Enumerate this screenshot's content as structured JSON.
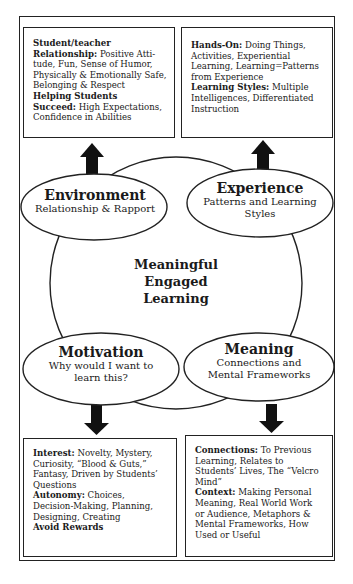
{
  "diagram": {
    "center": {
      "line1": "Meaningful",
      "line2": "Engaged",
      "line3": "Learning"
    },
    "ovals": {
      "environment": {
        "title": "Environment",
        "subtitle_line1": "Relationship & Rapport"
      },
      "experience": {
        "title": "Experience",
        "subtitle_line1": "Patterns and Learning",
        "subtitle_line2": "Styles"
      },
      "motivation": {
        "title": "Motivation",
        "subtitle_line1": "Why would I want to",
        "subtitle_line2": "learn this?"
      },
      "meaning": {
        "title": "Meaning",
        "subtitle_line1": "Connections and",
        "subtitle_line2": "Mental Frameworks"
      }
    },
    "boxes": {
      "environment": {
        "lines": [
          {
            "bold": "Student/teacher",
            "text": ""
          },
          {
            "bold": "Relationship:",
            "text": " Positive Atti-"
          },
          {
            "bold": "",
            "text": "tude, Fun, Sense of Humor,"
          },
          {
            "bold": "",
            "text": "Physically & Emotionally Safe,"
          },
          {
            "bold": "",
            "text": "Belonging & Respect"
          },
          {
            "bold": "Helping Students",
            "text": ""
          },
          {
            "bold": "Succeed:",
            "text": " High Expectations,"
          },
          {
            "bold": "",
            "text": "Confidence in Abilities"
          }
        ]
      },
      "experience": {
        "lines": [
          {
            "bold": "Hands-On:",
            "text": " Doing Things,"
          },
          {
            "bold": "",
            "text": "Activities, Experiential"
          },
          {
            "bold": "",
            "text": "Learning, Learning=Patterns"
          },
          {
            "bold": "",
            "text": "from Experience"
          },
          {
            "bold": "Learning Styles:",
            "text": " Multiple"
          },
          {
            "bold": "",
            "text": "Intelligences, Differentiated"
          },
          {
            "bold": "",
            "text": "Instruction"
          }
        ]
      },
      "motivation": {
        "lines": [
          {
            "bold": "Interest:",
            "text": " Novelty, Mystery,"
          },
          {
            "bold": "",
            "text": "Curiosity, “Blood & Guts,”"
          },
          {
            "bold": "",
            "text": "Fantasy, Driven by Students’"
          },
          {
            "bold": "",
            "text": "Questions"
          },
          {
            "bold": "Autonomy:",
            "text": " Choices,"
          },
          {
            "bold": "",
            "text": "Decision-Making, Planning,"
          },
          {
            "bold": "",
            "text": "Designing, Creating"
          },
          {
            "bold": "Avoid Rewards",
            "text": ""
          }
        ]
      },
      "meaning": {
        "lines": [
          {
            "bold": "Connections:",
            "text": " To Previous"
          },
          {
            "bold": "",
            "text": "Learning, Relates to"
          },
          {
            "bold": "",
            "text": "Students’ Lives, The “Velcro"
          },
          {
            "bold": "",
            "text": "Mind”"
          },
          {
            "bold": "Context:",
            "text": " Making Personal"
          },
          {
            "bold": "",
            "text": "Meaning, Real World Work"
          },
          {
            "bold": "",
            "text": "or Audience, Metaphors &"
          },
          {
            "bold": "",
            "text": "Mental Frameworks, How"
          },
          {
            "bold": "",
            "text": "Used or Useful"
          }
        ]
      }
    },
    "colors": {
      "stroke": "#222222",
      "background": "#ffffff",
      "text": "#1a1a1a"
    }
  }
}
